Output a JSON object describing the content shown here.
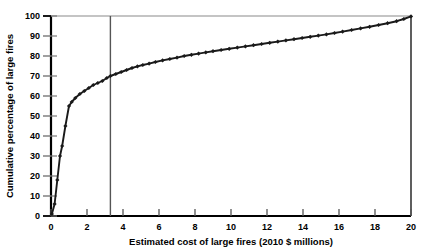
{
  "chart_data": {
    "type": "line",
    "title": "",
    "xlabel": "Estimated cost of large fires (2010 $ millions)",
    "ylabel": "Cumulative percentage of large fires",
    "xlim": [
      0,
      20
    ],
    "ylim": [
      0,
      100
    ],
    "xticks": [
      0,
      2,
      4,
      6,
      8,
      10,
      12,
      14,
      16,
      18,
      20
    ],
    "yticks": [
      0,
      10,
      20,
      30,
      40,
      50,
      60,
      70,
      80,
      90,
      100
    ],
    "xtick_labels": [
      "0",
      "2",
      "4",
      "6",
      "8",
      "10",
      "12",
      "14",
      "16",
      "18",
      "20"
    ],
    "ytick_labels": [
      "0",
      "10",
      "20",
      "30",
      "40",
      "50",
      "60",
      "70",
      "80",
      "90",
      "100"
    ],
    "grid": false,
    "legend": "none",
    "marker": "diamond",
    "line_color": "#1a1a1a",
    "marker_color": "#1a1a1a",
    "annotations": [
      {
        "name": "vertical-reference-line",
        "type": "vline",
        "x": 3.3,
        "color": "#555555"
      }
    ],
    "series": [
      {
        "name": "Cumulative percentage of large fires",
        "x": [
          0.05,
          0.2,
          0.35,
          0.5,
          0.62,
          0.8,
          1.0,
          1.15,
          1.35,
          1.6,
          1.85,
          2.1,
          2.35,
          2.6,
          2.85,
          3.1,
          3.3,
          3.6,
          3.9,
          4.2,
          4.5,
          4.8,
          5.1,
          5.45,
          5.8,
          6.2,
          6.6,
          7.0,
          7.4,
          7.8,
          8.2,
          8.6,
          9.0,
          9.45,
          9.9,
          10.35,
          10.8,
          11.25,
          11.7,
          12.15,
          12.6,
          13.05,
          13.5,
          13.95,
          14.4,
          14.85,
          15.3,
          15.75,
          16.2,
          16.7,
          17.2,
          17.7,
          18.2,
          18.7,
          19.2,
          19.6,
          20.0
        ],
        "y": [
          1,
          6,
          18,
          30,
          35,
          45,
          55,
          57,
          59,
          61,
          62.5,
          64,
          65.5,
          66.5,
          67.5,
          69,
          70,
          71,
          72,
          73,
          74,
          74.8,
          75.5,
          76.2,
          77,
          77.8,
          78.5,
          79.2,
          80,
          80.6,
          81.2,
          81.8,
          82.4,
          83,
          83.6,
          84.2,
          84.8,
          85.4,
          86,
          86.6,
          87.2,
          87.8,
          88.4,
          89,
          89.6,
          90.2,
          90.8,
          91.5,
          92.2,
          93,
          93.8,
          94.6,
          95.5,
          96.4,
          97.4,
          98.5,
          99.8
        ]
      }
    ]
  },
  "axes": {
    "y_label_text": "Cumulative percentage of large fires",
    "x_label_text": "Estimated cost of large fires (2010 $ millions)"
  }
}
